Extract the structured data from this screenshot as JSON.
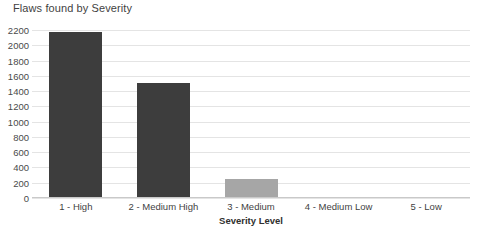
{
  "chart_data": {
    "type": "bar",
    "title": "Flaws found by Severity",
    "xlabel": "Severity Level",
    "ylabel": "",
    "categories": [
      "1 - High",
      "2 - Medium High",
      "3 - Medium",
      "4 - Medium Low",
      "5 - Low"
    ],
    "values": [
      2170,
      1500,
      250,
      0,
      0
    ],
    "ylim": [
      0,
      2200
    ],
    "ytick_step": 200,
    "yticks": [
      "2200",
      "2000",
      "1800",
      "1600",
      "1400",
      "1200",
      "1000",
      "800",
      "600",
      "400",
      "200",
      "0"
    ],
    "grid": true,
    "legend": "none",
    "bar_colors": [
      "#3d3d3d",
      "#3d3d3d",
      "#a6a6a6",
      "#a6a6a6",
      "#a6a6a6"
    ],
    "gridline_color": "#e4e4e4",
    "axis_color": "#c9c9c9",
    "text_color": "#3f3f3f",
    "background": "#ffffff"
  }
}
